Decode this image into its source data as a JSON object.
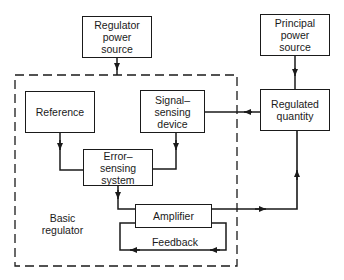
{
  "diagram": {
    "type": "block-diagram",
    "boundary_label": "Basic\nregulator",
    "blocks": {
      "regulator_power_source": "Regulator\npower\nsource",
      "principal_power_source": "Principal\npower\nsource",
      "reference": "Reference",
      "signal_sensing_device": "Signal–\nsensing\ndevice",
      "regulated_quantity": "Regulated\nquantity",
      "error_sensing_system": "Error–\nsensing\nsystem",
      "amplifier": "Amplifier"
    },
    "feedback_label": "Feedback",
    "edges": [
      {
        "from": "Regulator power source",
        "to": "Basic regulator"
      },
      {
        "from": "Principal power source",
        "to": "Regulated quantity"
      },
      {
        "from": "Regulated quantity",
        "to": "Signal-sensing device"
      },
      {
        "from": "Reference",
        "to": "Error-sensing system"
      },
      {
        "from": "Signal-sensing device",
        "to": "Error-sensing system"
      },
      {
        "from": "Error-sensing system",
        "to": "Amplifier"
      },
      {
        "from": "Amplifier",
        "to": "Regulated quantity"
      },
      {
        "from": "Amplifier",
        "to": "Amplifier",
        "label": "Feedback"
      }
    ]
  }
}
